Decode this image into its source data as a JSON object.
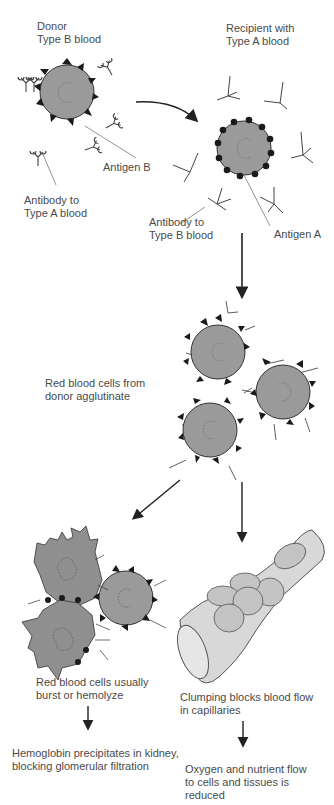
{
  "colors": {
    "cell_fill": "#9a9a9a",
    "cell_stroke": "#333333",
    "antigen": "#1a1a1a",
    "antibody": "#444444",
    "arrow": "#222222",
    "text": "#4a4a4a",
    "capillary_fill": "#d8d8d8"
  },
  "labels": {
    "donor": "Donor\nType B blood",
    "recipient": "Recipient with\nType A blood",
    "antigen_b": "Antigen B",
    "antibody_a": "Antibody to\nType A blood",
    "antibody_b": "Antibody to\nType B blood",
    "antigen_a": "Antigen A",
    "agglutinate": "Red blood cells from\ndonor agglutinate",
    "hemolyze": "Red blood cells usually\nburst or hemolyze",
    "clumping": "Clumping blocks blood flow\nin capillaries",
    "hemoglobin": "Hemoglobin precipitates in kidney,\nblocking glomerular filtration",
    "oxygen": "Oxygen and nutrient flow\nto cells and tissues is\nreduced"
  }
}
